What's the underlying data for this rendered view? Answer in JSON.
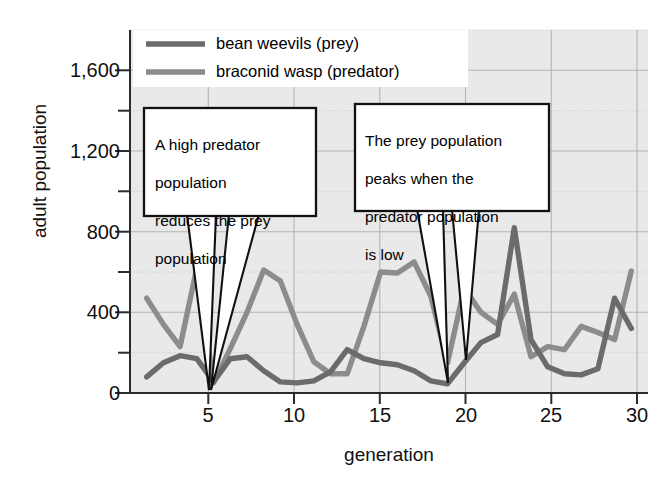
{
  "chart_data": {
    "type": "line",
    "title": "",
    "subtitle": "",
    "xlabel": "generation",
    "ylabel": "adult population",
    "xlim": [
      0,
      31
    ],
    "ylim": [
      0,
      1800
    ],
    "grid": true,
    "legend_position": "top-center",
    "x_ticks": [
      5,
      10,
      15,
      20,
      25,
      30
    ],
    "x_tick_labels": [
      "5",
      "10",
      "15",
      "20",
      "25",
      "30"
    ],
    "y_ticks": [
      0,
      400,
      800,
      1200,
      1600
    ],
    "y_tick_labels": [
      "0",
      "400",
      "800",
      "1,200",
      "1,600"
    ],
    "y_minor_ticks": [
      200,
      600,
      1000,
      1400,
      1800
    ],
    "x": [
      1,
      2,
      3,
      4,
      5,
      6,
      7,
      8,
      9,
      10,
      11,
      12,
      13,
      14,
      15,
      16,
      17,
      18,
      19,
      20,
      21,
      22,
      23,
      24,
      25,
      26,
      27,
      28,
      29,
      30
    ],
    "series": [
      {
        "name": "bean weevils (prey)",
        "role": "prey",
        "color": "#6b6b6b",
        "values": [
          80,
          150,
          185,
          170,
          55,
          170,
          180,
          110,
          55,
          50,
          60,
          105,
          215,
          170,
          150,
          140,
          110,
          60,
          45,
          150,
          250,
          290,
          820,
          265,
          130,
          95,
          90,
          120,
          470,
          320
        ]
      },
      {
        "name": "braconid wasp (predator)",
        "role": "predator",
        "color": "#8c8c8c",
        "values": [
          470,
          340,
          230,
          620,
          50,
          220,
          400,
          610,
          555,
          340,
          155,
          95,
          95,
          330,
          600,
          595,
          650,
          480,
          150,
          520,
          400,
          340,
          490,
          180,
          230,
          215,
          330,
          300,
          265,
          605
        ]
      }
    ],
    "annotations": [
      {
        "id": "callout-predator",
        "text": "A high predator\npopulation\nreduces the prey\npopulation",
        "points_to": [
          5,
          5
        ]
      },
      {
        "id": "callout-prey",
        "text": "The prey population\npeaks when the\npredator population\nis low",
        "points_to": [
          19,
          20
        ]
      }
    ]
  },
  "legend": {
    "items": [
      {
        "label": "bean weevils (prey)",
        "color": "#6b6b6b"
      },
      {
        "label": "braconid wasp (predator)",
        "color": "#8c8c8c"
      }
    ]
  },
  "axes": {
    "y_title": "adult population",
    "x_title": "generation",
    "y_labels": [
      "1,600",
      "1,200",
      "800",
      "400",
      "0"
    ],
    "x_labels": [
      "5",
      "10",
      "15",
      "20",
      "25",
      "30"
    ]
  },
  "callouts": {
    "left": {
      "line1": "A high predator",
      "line2": "population",
      "line3": "reduces the prey",
      "line4": "population"
    },
    "right": {
      "line1": "The prey population",
      "line2": "peaks when the",
      "line3": "predator population",
      "line4": "is low"
    }
  },
  "colors": {
    "plot_background": "#e9e9e9",
    "grid_major": "#b9b9b9",
    "grid_minor": "#cfcfcf",
    "axis": "#2b2b2b",
    "prey_line": "#6b6b6b",
    "predator_line": "#8c8c8c",
    "box_fill": "#ffffff",
    "box_stroke": "#111111"
  }
}
